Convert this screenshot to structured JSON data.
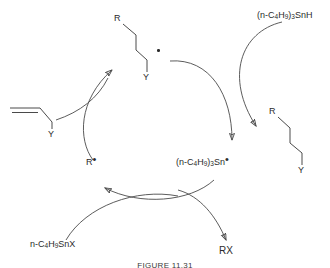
{
  "figure": {
    "caption": "FIGURE 11.31",
    "ink_color": "#2b2b2b",
    "line_color": "#4a4a4a",
    "background": "#ffffff"
  },
  "species": {
    "alkene_y_label": "Y",
    "adduct_radical": {
      "r_label": "R",
      "y_label": "Y",
      "radical": "•"
    },
    "product": {
      "r_label": "R",
      "y_label": "Y"
    },
    "tin_hydride": {
      "prefix": "(n-C",
      "sub1": "4",
      "mid": "H",
      "sub2": "9",
      "close": ")",
      "sub3": "3",
      "suffix": "SnH",
      "full": "(n-C4H9)3SnH"
    },
    "tin_radical": {
      "prefix": "(n-C",
      "sub1": "4",
      "mid": "H",
      "sub2": "9",
      "close": ")",
      "sub3": "3",
      "suffix": "Sn",
      "radical": "•",
      "full": "(n-C4H9)3Sn•"
    },
    "tin_halide": {
      "prefix": "n-C",
      "sub1": "4",
      "mid": "H",
      "sub2": "9",
      "suffix": "SnX",
      "full": "n-C4H9SnX"
    },
    "carbon_radical": {
      "r_label": "R",
      "radical": "•"
    },
    "alkyl_halide": "RX"
  }
}
